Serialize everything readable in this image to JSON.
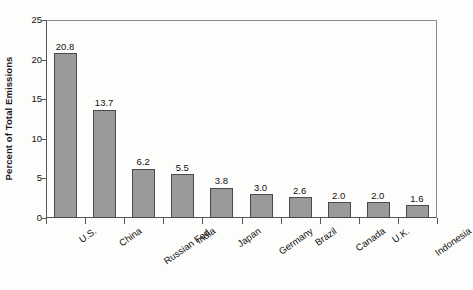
{
  "chart_data": {
    "type": "bar",
    "title": "",
    "subtitle": "",
    "xlabel": "",
    "ylabel": "Percent of Total Emissions",
    "ylim": [
      0,
      25
    ],
    "ytick_labels": [
      "0",
      "5",
      "10",
      "15",
      "20",
      "25"
    ],
    "ytick_values": [
      0,
      5,
      10,
      15,
      20,
      25
    ],
    "grid": false,
    "legend": false,
    "legend_position": "none",
    "bar_color": "#9a9a9a",
    "bar_border_color": "#4a4a4a",
    "axis_color": "#555555",
    "frame_color": "#8c8c8c",
    "background_color": "#fdfdfb",
    "value_label_format": "one-decimal",
    "xtick_placement": "between-categories",
    "xtick_label_rotation": -35,
    "categories": [
      "U.S.",
      "China",
      "Russian Fed.",
      "India",
      "Japan",
      "Germany",
      "Brazil",
      "Canada",
      "U.K.",
      "Indonesia"
    ],
    "values": [
      20.8,
      13.7,
      6.2,
      5.5,
      3.8,
      3.0,
      2.6,
      2.0,
      2.0,
      1.6
    ],
    "value_labels": [
      "20.8",
      "13.7",
      "6.2",
      "5.5",
      "3.8",
      "3.0",
      "2.6",
      "2.0",
      "2.0",
      "1.6"
    ]
  }
}
